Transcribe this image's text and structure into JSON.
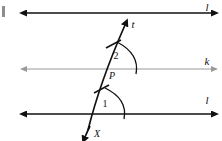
{
  "diagram": {
    "background_color": "#ffffff",
    "ink_color": "#111111",
    "mid_line_color": "#9a9a9a",
    "lines": [
      {
        "id": "top-line",
        "label": "l",
        "label_x": 207,
        "label_y": 11,
        "y": 13,
        "x_start": 27,
        "x_end": 212,
        "color": "#111111",
        "width": 1.6,
        "arrow_left": true,
        "arrow_right": true
      },
      {
        "id": "middle-line",
        "label": "k",
        "label_x": 207,
        "label_y": 65,
        "y": 69,
        "x_start": 27,
        "x_end": 212,
        "color": "#9a9a9a",
        "width": 1.2,
        "arrow_left": true,
        "arrow_right": true
      },
      {
        "id": "bottom-line",
        "label": "l",
        "label_x": 207,
        "label_y": 104,
        "y": 114,
        "x_start": 27,
        "x_end": 212,
        "color": "#111111",
        "width": 1.6,
        "arrow_left": true,
        "arrow_right": true
      }
    ],
    "transversal": {
      "id": "transversal-t",
      "label": "t",
      "label_x": 133,
      "label_y": 28,
      "x_top": 127,
      "y_top": 22,
      "x_bottom": 86,
      "y_bottom": 133,
      "color": "#111111",
      "width": 1.7,
      "arrow_top": true,
      "arrow_bottom": true
    },
    "points": [
      {
        "id": "point-P",
        "label": "P",
        "label_x": 112,
        "label_y": 79,
        "x": 106,
        "y": 69
      },
      {
        "id": "point-X",
        "label": "X",
        "label_x": 95,
        "label_y": 136,
        "x": 89,
        "y": 126
      }
    ],
    "angles": [
      {
        "id": "angle-2",
        "label": "2",
        "label_x": 115,
        "label_y": 58,
        "vertex_x": 106,
        "vertex_y": 69,
        "arc_radius": 30,
        "description": "angle between transversal and line k, above P"
      },
      {
        "id": "angle-1",
        "label": "1",
        "label_x": 105,
        "label_y": 106,
        "vertex_x": 96,
        "vertex_y": 114,
        "arc_radius": 28,
        "description": "angle between transversal and bottom line l"
      }
    ],
    "tick_marks": [
      {
        "id": "tick-upper",
        "x": 113,
        "y": 44,
        "description": "congruence hash mark on upper transversal segment"
      },
      {
        "id": "tick-lower",
        "x": 101,
        "y": 89,
        "description": "congruence hash mark on lower transversal segment"
      }
    ],
    "artifact": {
      "id": "scan-speck",
      "x": 2,
      "y": 6,
      "width": 3,
      "height": 11
    }
  }
}
